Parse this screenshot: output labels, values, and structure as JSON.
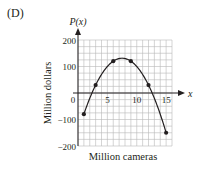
{
  "panel_label": "(D)",
  "chart_data": {
    "type": "line",
    "title": "",
    "xlabel": "Million cameras",
    "ylabel": "Million dollars",
    "y_axis_name": "P(x)",
    "x_axis_name": "x",
    "xlim": [
      0,
      16
    ],
    "ylim": [
      -200,
      200
    ],
    "x_ticks": [
      0,
      5,
      10,
      15
    ],
    "x_tick_labels": [
      "0",
      "5",
      "10",
      "15"
    ],
    "y_ticks": [
      200,
      100,
      -100,
      -200
    ],
    "y_tick_labels": [
      "200",
      "100",
      "−100",
      "−200"
    ],
    "grid": true,
    "grid_x_step": 1,
    "grid_y_step": 25,
    "series": [
      {
        "name": "P(x)",
        "curve": "parabola",
        "x": [
          1,
          3,
          6,
          9,
          12,
          15
        ],
        "values": [
          -80,
          30,
          120,
          120,
          30,
          -150
        ],
        "markers": true
      }
    ],
    "colors": {
      "axis": "#231f20",
      "grid": "#b9b9b9",
      "curve": "#231f20"
    }
  }
}
